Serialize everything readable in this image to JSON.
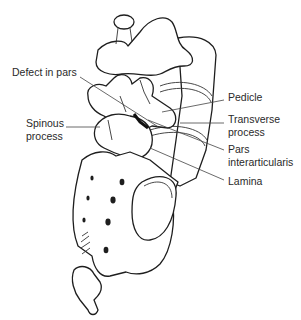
{
  "figure": {
    "labels": {
      "defect": "Defect in pars",
      "spinous_1": "Spinous",
      "spinous_2": "process",
      "pedicle": "Pedicle",
      "transverse_1": "Transverse",
      "transverse_2": "process",
      "pars_1": "Pars",
      "pars_2": "interarticularis",
      "lamina": "Lamina"
    },
    "colors": {
      "line": "#1e1e1e",
      "text": "#2a2a2a",
      "background": "#ffffff"
    }
  }
}
